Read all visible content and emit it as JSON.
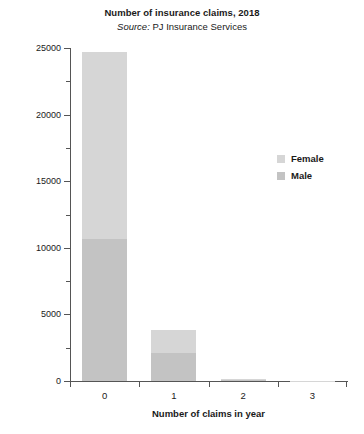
{
  "chart_data": {
    "type": "bar",
    "stacked": true,
    "title": "Number of insurance claims, 2018",
    "subtitle": "Source: PJ Insurance Services",
    "subtitle_prefix": "Source:",
    "subtitle_rest": " PJ Insurance Services",
    "xlabel": "Number of claims in year",
    "ylabel": "Number of people making claims",
    "categories": [
      "0",
      "1",
      "2",
      "3"
    ],
    "series": [
      {
        "name": "Male",
        "color": "#c3c3c3",
        "values": [
          10650,
          2100,
          120,
          15
        ]
      },
      {
        "name": "Female",
        "color": "#d6d6d6",
        "values": [
          14050,
          1730,
          60,
          10
        ]
      }
    ],
    "totals": [
      24700,
      3830,
      180,
      25
    ],
    "ylim": [
      0,
      25000
    ],
    "ytick_labels": [
      "0",
      "5000",
      "10000",
      "15000",
      "20000",
      "25000"
    ],
    "ytick_values": [
      0,
      5000,
      10000,
      15000,
      20000,
      25000
    ],
    "yminor_values": [
      2500,
      7500,
      12500,
      17500,
      22500
    ],
    "grid": false,
    "legend_position": "right",
    "legend_entries": [
      {
        "label": "Female",
        "color": "#d6d6d6"
      },
      {
        "label": "Male",
        "color": "#c3c3c3"
      }
    ]
  }
}
